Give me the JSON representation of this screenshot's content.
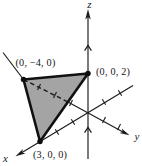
{
  "figure": {
    "type": "3d-coordinate-axes-with-plane-triangle",
    "background_color": "#ffffff",
    "line_color": "#1b1b1b",
    "plane_fill_color": "#a4a4a4",
    "axis_labels": {
      "x": "x",
      "y": "y",
      "z": "z"
    },
    "intercept_points": [
      {
        "name": "y-intercept",
        "label": "(0, −4, 0)",
        "coords": [
          0,
          -4,
          0
        ]
      },
      {
        "name": "z-intercept",
        "label": "(0, 0, 2)",
        "coords": [
          0,
          0,
          2
        ]
      },
      {
        "name": "x-intercept",
        "label": "(3, 0, 0)",
        "coords": [
          3,
          0,
          0
        ]
      }
    ],
    "hidden_edge_style": "dashed segment of negative y-axis passing behind the shaded plane",
    "tick_marks": {
      "x_axis_ticks": 4,
      "y_axis_ticks": 5,
      "z_axis_chevrons": 2
    }
  }
}
